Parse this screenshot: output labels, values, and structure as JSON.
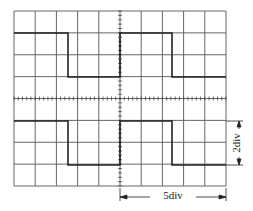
{
  "diagram": {
    "type": "oscilloscope-screen",
    "grid": {
      "columns": 10,
      "rows": 8,
      "left": 14,
      "top": 11,
      "right": 226,
      "bottom": 186,
      "line_color": "#555555",
      "trace_color": "#222222"
    },
    "traces": [
      {
        "name": "upper-square-wave",
        "high_y": 33,
        "low_y": 77,
        "transitions_x": [
          68,
          120,
          172
        ],
        "start_level": "high"
      },
      {
        "name": "lower-square-wave",
        "high_y": 121,
        "low_y": 165,
        "transitions_x": [
          68,
          120,
          172
        ],
        "start_level": "high"
      }
    ],
    "annotations": {
      "vertical_dimension_label": "2div",
      "horizontal_dimension_label": "5div"
    }
  }
}
